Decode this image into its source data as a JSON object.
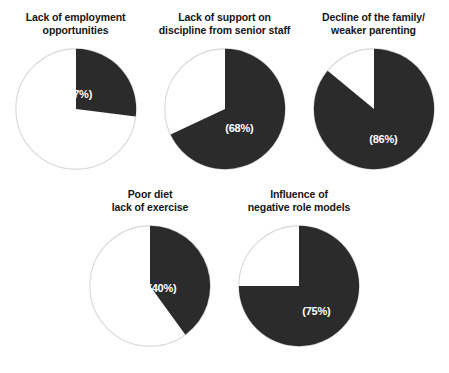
{
  "page": {
    "cropped_header_text": "",
    "background_color": "#ffffff"
  },
  "style": {
    "slice_color": "#2b2b2b",
    "remainder_color": "#ffffff",
    "outline_color": "#d8d8d8",
    "value_text_color": "#ffffff",
    "title_text_color": "#161616"
  },
  "chart_data": {
    "type": "pie",
    "title": "",
    "xlabel": "",
    "ylabel": "",
    "legend": "none",
    "grid": false,
    "note": "Five separate single-value pie charts; each dark slice begins at 12 o'clock and sweeps clockwise by the stated percentage.",
    "charts": [
      {
        "title_line1": "Lack of employment",
        "title_line2": "opportunities",
        "categories": [
          "Lack of employment opportunities",
          "Remainder"
        ],
        "values": [
          27,
          73
        ],
        "value_label": "(27%)",
        "percent": 27,
        "label_x_pct": 52,
        "label_y_pct": 38
      },
      {
        "title_line1": "Lack of support on",
        "title_line2": "discipline from senior staff",
        "categories": [
          "Lack of support on discipline from senior staff",
          "Remainder"
        ],
        "values": [
          68,
          32
        ],
        "value_label": "(68%)",
        "percent": 68,
        "label_x_pct": 62,
        "label_y_pct": 65
      },
      {
        "title_line1": "Decline of the family/",
        "title_line2": "weaker parenting",
        "categories": [
          "Decline of the family / weaker parenting",
          "Remainder"
        ],
        "values": [
          86,
          14
        ],
        "value_label": "(86%)",
        "percent": 86,
        "label_x_pct": 58,
        "label_y_pct": 74
      },
      {
        "title_line1": "Poor diet",
        "title_line2": "lack of exercise",
        "categories": [
          "Poor diet / lack of exercise",
          "Remainder"
        ],
        "values": [
          40,
          60
        ],
        "value_label": "(40%)",
        "percent": 40,
        "label_x_pct": 60,
        "label_y_pct": 52
      },
      {
        "title_line1": "Influence of",
        "title_line2": "negative role models",
        "categories": [
          "Influence of negative role models",
          "Remainder"
        ],
        "values": [
          75,
          25
        ],
        "value_label": "(75%)",
        "percent": 75,
        "label_x_pct": 64,
        "label_y_pct": 70
      }
    ]
  }
}
